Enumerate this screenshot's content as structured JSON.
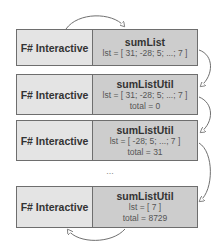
{
  "diagram": {
    "frames": [
      {
        "caller": "F# Interactive",
        "function": "sumList",
        "lines": [
          "lst = [ 31; -28; 5; ...; 7 ]"
        ]
      },
      {
        "caller": "F# Interactive",
        "function": "sumListUtil",
        "lines": [
          "lst = [ 31; -28; 5; ...; 7 ]",
          "total = 0"
        ]
      },
      {
        "caller": "F# Interactive",
        "function": "sumListUtil",
        "lines": [
          "lst = [ -28; 5; ...; 7 ]",
          "total = 31"
        ]
      },
      {
        "caller": "F# Interactive",
        "function": "sumListUtil",
        "lines": [
          "lst = [ 7 ]",
          "total = 8729"
        ]
      }
    ],
    "ellipsis": "...",
    "colors": {
      "caller_cell": "#e4e4e4",
      "function_cell": "#cdcdcd",
      "border": "#6e6e6e",
      "arrow": "#707070"
    }
  }
}
